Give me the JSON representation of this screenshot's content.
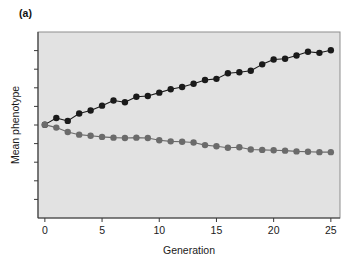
{
  "figure": {
    "panel_label": "(a)",
    "background_color": "#ffffff",
    "plot_background_color": "#e2e2e2",
    "plot_border_color": "#8d8d8d"
  },
  "chart_data": {
    "type": "line",
    "title": "",
    "subtitle": "",
    "xlabel": "Generation",
    "ylabel": "Mean phenotype",
    "xlim": [
      -0.6,
      25.8
    ],
    "ylim": [
      0,
      10
    ],
    "xticks": [
      0,
      5,
      10,
      15,
      20,
      25
    ],
    "xtick_labels": [
      "0",
      "5",
      "10",
      "15",
      "20",
      "25"
    ],
    "yticks": [
      1,
      2,
      3,
      4,
      5,
      6,
      7,
      8,
      9
    ],
    "ytick_labels": [
      "",
      "",
      "",
      "",
      "",
      "",
      "",
      "",
      ""
    ],
    "grid": false,
    "legend": false,
    "legend_position": "none",
    "x": [
      0,
      1,
      2,
      3,
      4,
      5,
      6,
      7,
      8,
      9,
      10,
      11,
      12,
      13,
      14,
      15,
      16,
      17,
      18,
      19,
      20,
      21,
      22,
      23,
      24,
      25
    ],
    "series": [
      {
        "name": "Upward selected line",
        "color": "#1a1a1a",
        "marker": "filled-circle",
        "marker_size": 3.2,
        "line_width": 1.1,
        "values": [
          5.02,
          5.38,
          5.22,
          5.62,
          5.78,
          6.04,
          6.32,
          6.22,
          6.52,
          6.56,
          6.74,
          6.92,
          7.04,
          7.22,
          7.42,
          7.48,
          7.78,
          7.84,
          7.92,
          8.26,
          8.52,
          8.56,
          8.74,
          8.94,
          8.88,
          9.02
        ]
      },
      {
        "name": "Downward selected line",
        "color": "#6b6b6b",
        "marker": "filled-circle",
        "marker_size": 3.2,
        "line_width": 1.1,
        "values": [
          5.02,
          4.86,
          4.62,
          4.48,
          4.42,
          4.36,
          4.32,
          4.3,
          4.32,
          4.3,
          4.18,
          4.12,
          4.1,
          4.06,
          3.92,
          3.86,
          3.78,
          3.8,
          3.68,
          3.66,
          3.64,
          3.62,
          3.58,
          3.56,
          3.54,
          3.54
        ]
      }
    ]
  }
}
